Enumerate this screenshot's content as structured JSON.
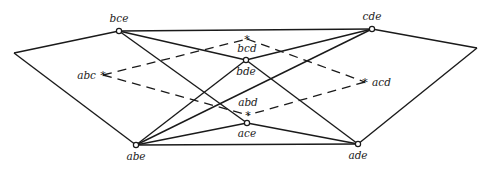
{
  "diagram": {
    "type": "graph",
    "outer_points": [
      {
        "id": "outer-left",
        "x": 14,
        "y": 53
      },
      {
        "id": "outer-right",
        "x": 477,
        "y": 48
      }
    ],
    "vertices": [
      {
        "id": "bce",
        "label": "bce",
        "x": 119,
        "y": 31,
        "kind": "circle",
        "lx": 119,
        "ly": 22,
        "anchor": "middle"
      },
      {
        "id": "cde",
        "label": "cde",
        "x": 372,
        "y": 29,
        "kind": "circle",
        "lx": 372,
        "ly": 20,
        "anchor": "middle"
      },
      {
        "id": "bde",
        "label": "bde",
        "x": 246,
        "y": 60,
        "kind": "circle",
        "lx": 246,
        "ly": 75,
        "anchor": "middle"
      },
      {
        "id": "ace",
        "label": "ace",
        "x": 247,
        "y": 123,
        "kind": "circle",
        "lx": 247,
        "ly": 137,
        "anchor": "middle"
      },
      {
        "id": "abe",
        "label": "abe",
        "x": 136,
        "y": 145,
        "kind": "circle",
        "lx": 136,
        "ly": 160,
        "anchor": "middle"
      },
      {
        "id": "ade",
        "label": "ade",
        "x": 358,
        "y": 144,
        "kind": "circle",
        "lx": 358,
        "ly": 159,
        "anchor": "middle"
      },
      {
        "id": "abc",
        "label": "abc",
        "x": 103,
        "y": 75,
        "kind": "star",
        "lx": 96,
        "ly": 79,
        "anchor": "end"
      },
      {
        "id": "bcd",
        "label": "bcd",
        "x": 247,
        "y": 39,
        "kind": "star",
        "lx": 247,
        "ly": 52,
        "anchor": "middle"
      },
      {
        "id": "acd",
        "label": "acd",
        "x": 365,
        "y": 82,
        "kind": "star",
        "lx": 372,
        "ly": 86,
        "anchor": "start"
      },
      {
        "id": "abd",
        "label": "abd",
        "x": 248,
        "y": 115,
        "kind": "star",
        "lx": 248,
        "ly": 106,
        "anchor": "middle"
      }
    ],
    "solid_edges": [
      [
        "outer-left",
        "bce"
      ],
      [
        "outer-left",
        "abe"
      ],
      [
        "bce",
        "cde"
      ],
      [
        "cde",
        "outer-right"
      ],
      [
        "outer-right",
        "ade"
      ],
      [
        "bce",
        "bde"
      ],
      [
        "bce",
        "ace"
      ],
      [
        "cde",
        "bde"
      ],
      [
        "cde",
        "abe"
      ],
      [
        "bde",
        "abe"
      ],
      [
        "bde",
        "ade"
      ],
      [
        "abe",
        "ace"
      ],
      [
        "ace",
        "ade"
      ],
      [
        "abe",
        "ade"
      ]
    ],
    "dashed_edges": [
      [
        "abc",
        "bcd"
      ],
      [
        "abc",
        "abd"
      ],
      [
        "bcd",
        "acd"
      ],
      [
        "acd",
        "abd"
      ]
    ],
    "star_glyph": "*"
  }
}
